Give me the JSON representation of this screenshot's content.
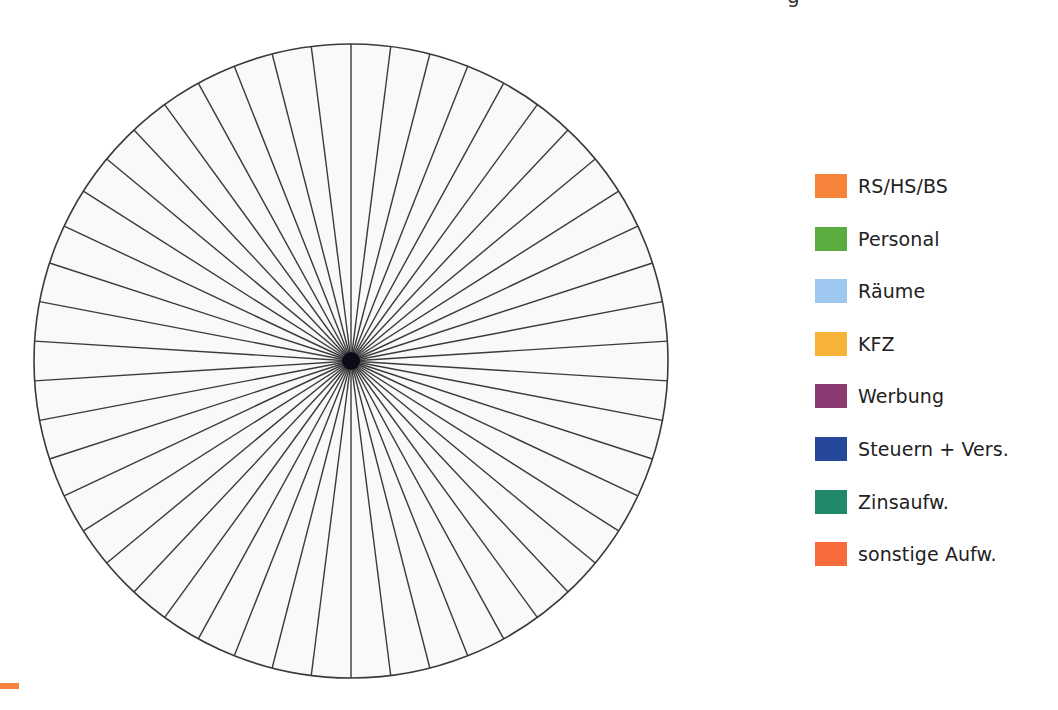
{
  "chart_data": {
    "type": "pie",
    "title": "",
    "segments": 50,
    "segment_angle_deg": 7.2,
    "values": [],
    "legend_position": "right",
    "legend": [
      {
        "label": "RS/HS/BS",
        "color": "#f5843a"
      },
      {
        "label": "Personal",
        "color": "#5aac3e"
      },
      {
        "label": "Räume",
        "color": "#9ec8f0"
      },
      {
        "label": "KFZ",
        "color": "#f8b43a"
      },
      {
        "label": "Werbung",
        "color": "#8c3a72"
      },
      {
        "label": "Steuern + Vers.",
        "color": "#26489a"
      },
      {
        "label": "Zinsaufw.",
        "color": "#21896a"
      },
      {
        "label": "sonstige Aufw.",
        "color": "#f66a3c"
      }
    ]
  },
  "pie": {
    "center_x": 351,
    "center_y": 361,
    "radius": 317,
    "segments": 50,
    "line_color": "#3a3a3a",
    "fill_color": "#f8f9fb"
  },
  "top_fragment": "g",
  "corner_bar_color": "#f5843a"
}
